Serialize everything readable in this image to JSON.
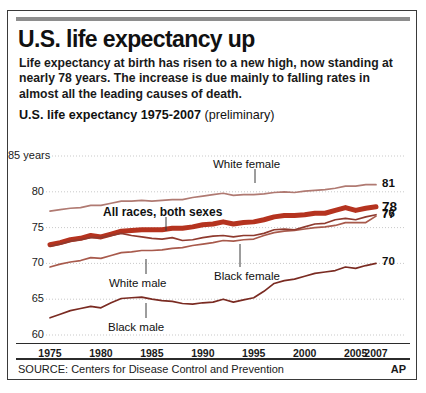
{
  "headline": "U.S. life expectancy up",
  "deck": "Life expectancy at birth has risen to a new high, now standing at nearly 78 years. The increase is due mainly to falling rates in almost all the leading causes of death.",
  "chart_title_main": "U.S. life expectancy 1975-2007",
  "chart_title_note": "(preliminary)",
  "source": "SOURCE: Centers for Disease Control and Prevention",
  "credit": "AP",
  "colors": {
    "all_races": "#b5331f",
    "white_female": "#b07a72",
    "white_male": "#a85a4c",
    "black_female": "#8f3a2e",
    "black_male": "#7a2b22",
    "gridline": "#c9c9c9",
    "rule": "#2b2b2b",
    "top_rule": "#8e8e8e"
  },
  "chart_data": {
    "type": "line",
    "title": "U.S. life expectancy 1975-2007 (preliminary)",
    "xlabel": "",
    "ylabel": "years",
    "ylim": [
      60,
      85
    ],
    "xlim": [
      1975,
      2007
    ],
    "grid": true,
    "legend": "inline-annotations",
    "y_axis_top_label": "85 years",
    "yticks": [
      "85 years",
      "80",
      "75",
      "70",
      "65",
      "60"
    ],
    "ytick_values": [
      85,
      80,
      75,
      70,
      65,
      60
    ],
    "xticks": [
      "1975",
      "1980",
      "1985",
      "1990",
      "1995",
      "2000",
      "2005",
      "2007"
    ],
    "xtick_values": [
      1975,
      1980,
      1985,
      1990,
      1995,
      2000,
      2005,
      2007
    ],
    "x": [
      1975,
      1976,
      1977,
      1978,
      1979,
      1980,
      1981,
      1982,
      1983,
      1984,
      1985,
      1986,
      1987,
      1988,
      1989,
      1990,
      1991,
      1992,
      1993,
      1994,
      1995,
      1996,
      1997,
      1998,
      1999,
      2000,
      2001,
      2002,
      2003,
      2004,
      2005,
      2006,
      2007
    ],
    "series": [
      {
        "name": "White female",
        "color": "#b07a72",
        "width": "thin",
        "end_label": "81",
        "end_value": 81,
        "values": [
          77.3,
          77.5,
          77.7,
          77.8,
          78.1,
          78.1,
          78.4,
          78.7,
          78.7,
          78.8,
          78.7,
          78.8,
          78.9,
          78.9,
          79.2,
          79.4,
          79.6,
          79.8,
          79.5,
          79.6,
          79.6,
          79.7,
          79.9,
          80.0,
          79.9,
          80.1,
          80.2,
          80.3,
          80.5,
          80.8,
          80.8,
          81.0,
          81.0
        ]
      },
      {
        "name": "All races, both sexes",
        "color": "#b5331f",
        "width": "thick",
        "end_label": "78",
        "end_value": 78,
        "values": [
          72.6,
          72.9,
          73.3,
          73.5,
          73.9,
          73.7,
          74.1,
          74.5,
          74.6,
          74.7,
          74.7,
          74.7,
          74.9,
          74.9,
          75.1,
          75.4,
          75.5,
          75.8,
          75.5,
          75.7,
          75.8,
          76.1,
          76.5,
          76.7,
          76.7,
          76.8,
          77.0,
          77.0,
          77.4,
          77.8,
          77.4,
          77.7,
          77.9
        ]
      },
      {
        "name": "White male",
        "color": "#a85a4c",
        "width": "thin",
        "end_label": "77",
        "end_value": 77,
        "values": [
          69.5,
          69.9,
          70.2,
          70.4,
          70.8,
          70.7,
          71.1,
          71.5,
          71.6,
          71.8,
          71.8,
          71.9,
          72.1,
          72.2,
          72.5,
          72.7,
          72.9,
          73.2,
          73.1,
          73.3,
          73.4,
          73.9,
          74.3,
          74.5,
          74.6,
          74.8,
          75.0,
          75.1,
          75.3,
          75.7,
          75.7,
          75.7,
          76.6
        ]
      },
      {
        "name": "Black female",
        "color": "#8f3a2e",
        "width": "thin",
        "end_label": "76",
        "end_value": 76,
        "values": [
          72.4,
          72.7,
          73.1,
          73.3,
          73.6,
          73.6,
          73.9,
          74.2,
          73.9,
          73.7,
          73.5,
          73.4,
          73.6,
          73.2,
          73.3,
          73.6,
          73.8,
          73.9,
          73.7,
          73.9,
          73.9,
          74.2,
          74.7,
          74.8,
          74.7,
          75.1,
          75.5,
          75.6,
          76.1,
          76.3,
          76.1,
          76.5,
          76.8
        ]
      },
      {
        "name": "Black male",
        "color": "#7a2b22",
        "width": "thin",
        "end_label": "70",
        "end_value": 70,
        "values": [
          62.4,
          62.9,
          63.4,
          63.7,
          64.0,
          63.8,
          64.5,
          65.1,
          65.2,
          65.3,
          65.0,
          64.8,
          64.7,
          64.4,
          64.3,
          64.5,
          64.6,
          65.0,
          64.6,
          64.9,
          65.2,
          66.1,
          67.2,
          67.6,
          67.8,
          68.2,
          68.6,
          68.8,
          69.0,
          69.5,
          69.3,
          69.7,
          70.0
        ]
      }
    ],
    "annotations": [
      {
        "text": "White female",
        "series": "White female",
        "x_year": 1992
      },
      {
        "text": "All races, both sexes",
        "series": "All races, both sexes",
        "x_year": 1985
      },
      {
        "text": "White male",
        "series": "White male",
        "x_year": 1983
      },
      {
        "text": "Black female",
        "series": "Black female",
        "x_year": 1991
      },
      {
        "text": "Black male",
        "series": "Black male",
        "x_year": 1984
      }
    ]
  }
}
